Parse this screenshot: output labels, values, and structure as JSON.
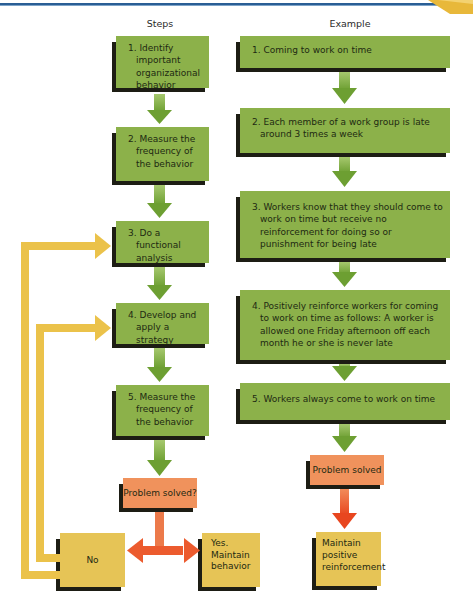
{
  "header": {
    "caption_fragment": "p                    g                    g",
    "rule_color": "#2a5e95",
    "corner_accent_color": "#e8b83a"
  },
  "columns": {
    "steps_label": "Steps",
    "example_label": "Example"
  },
  "steps": [
    {
      "num": "1.",
      "text": "Identify important organizational behavior"
    },
    {
      "num": "2.",
      "text": "Measure the frequency of the behavior"
    },
    {
      "num": "3.",
      "text": "Do a functional analysis"
    },
    {
      "num": "4.",
      "text": "Develop and apply a strategy"
    },
    {
      "num": "5.",
      "text": "Measure the frequency of the behavior"
    }
  ],
  "steps_decision": {
    "question": "Problem solved?",
    "no_label": "No",
    "yes_label": "Yes. Maintain behavior"
  },
  "example": [
    {
      "num": "1.",
      "text": "Coming to work on time"
    },
    {
      "num": "2.",
      "text": "Each member of a work group is late around 3 times a week"
    },
    {
      "num": "3.",
      "text": "Workers know that they should come to work on time but receive no reinforcement for doing so or punishment for being late"
    },
    {
      "num": "4.",
      "text": "Positively reinforce workers for coming to work on time as follows: A worker is allowed one Friday afternoon off each month he or she is never late"
    },
    {
      "num": "5.",
      "text": "Workers always come to work on time"
    }
  ],
  "example_outcome": {
    "result": "Problem solved",
    "action": "Maintain positive reinforcement"
  },
  "colors": {
    "step_box": "#8cb14a",
    "arrow_green": "#7aab3c",
    "decision_box": "#f0925c",
    "decision_arrow": "#ec5b2e",
    "outcome_box": "#e6c456",
    "feedback_arrow": "#ebc24a",
    "shadow": "#1d1d14"
  }
}
